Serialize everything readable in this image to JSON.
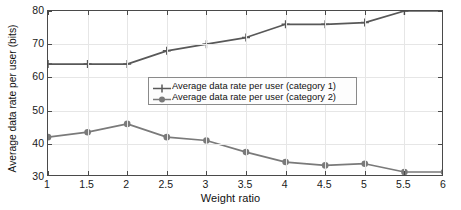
{
  "chart_data": {
    "type": "line",
    "title": "",
    "xlabel": "Weight ratio",
    "ylabel": "Average data rate per user (bits)",
    "x": [
      1,
      1.5,
      2,
      2.5,
      3,
      3.5,
      4,
      4.5,
      5,
      5.5,
      6
    ],
    "xlim": [
      1,
      6
    ],
    "ylim": [
      30,
      80
    ],
    "xticks": [
      1,
      1.5,
      2,
      2.5,
      3,
      3.5,
      4,
      4.5,
      5,
      5.5,
      6
    ],
    "xtick_labels": [
      "1",
      "1.5",
      "2",
      "2.5",
      "3",
      "3.5",
      "4",
      "4.5",
      "5",
      "5.5",
      "6"
    ],
    "yticks": [
      30,
      40,
      50,
      60,
      70,
      80
    ],
    "ytick_labels": [
      "30",
      "40",
      "50",
      "60",
      "70",
      "80"
    ],
    "grid": true,
    "legend_position": "center-right-inside",
    "series": [
      {
        "name": "Average data rate per user (category 1)",
        "marker": "plus",
        "color": "#585858",
        "values": [
          64,
          64,
          64,
          68,
          70,
          72,
          76,
          76,
          76.5,
          80,
          80
        ]
      },
      {
        "name": "Average data rate per user (category 2)",
        "marker": "circle",
        "color": "#7a7a7a",
        "values": [
          42,
          43.5,
          46,
          42,
          41,
          37.5,
          34.5,
          33.5,
          34,
          31.5,
          31.5
        ]
      }
    ]
  },
  "axis_colors": {
    "axis_line": "#4a4a4a",
    "gridline": "#e6e6e6",
    "background": "#ffffff",
    "text": "#111111"
  }
}
